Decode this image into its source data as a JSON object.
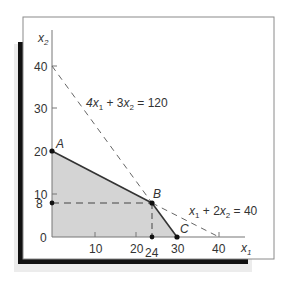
{
  "figure": {
    "axes": {
      "x_label": "x",
      "x_label_sub": "1",
      "y_label": "x",
      "y_label_sub": "2",
      "x_ticks": [
        "10",
        "20",
        "30",
        "40"
      ],
      "y_ticks": [
        "0",
        "10",
        "20",
        "30",
        "40"
      ],
      "x_extra_tick": "24",
      "y_extra_tick": "8"
    },
    "constraints": [
      {
        "label_parts": [
          "4x",
          "1",
          " + 3x",
          "2",
          " = 120"
        ],
        "equation": "4x1 + 3x2 = 120"
      },
      {
        "label_parts": [
          "x",
          "1",
          " + 2x",
          "2",
          " = 40"
        ],
        "equation": "x1 + 2x2 = 40"
      }
    ],
    "points": [
      {
        "name": "A",
        "x1": 0,
        "x2": 20
      },
      {
        "name": "B",
        "x1": 24,
        "x2": 8
      },
      {
        "name": "C",
        "x1": 30,
        "x2": 0
      }
    ],
    "colors": {
      "feasible_fill": "#d4d4d4",
      "frame_shadow": "#111111",
      "outer_shadow": "#ececec"
    }
  }
}
